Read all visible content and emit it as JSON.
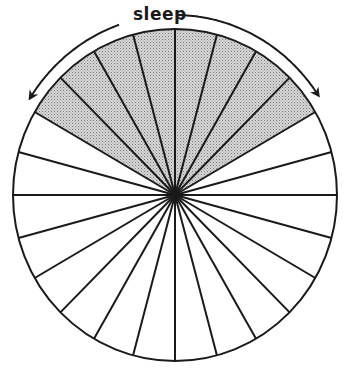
{
  "diagram": {
    "type": "24-hour day clock pie",
    "label": "sleep",
    "total_sectors": 24,
    "sector_degrees": 15,
    "shaded": {
      "start_deg": -60,
      "end_deg": 60,
      "sector_count": 8,
      "meaning": "sleep"
    },
    "unshaded_sector_count": 16,
    "colors": {
      "line": "#1a1a1a",
      "shade": "#c8c8c8",
      "shade_dot": "#8a8a8a",
      "background": "#ffffff"
    }
  },
  "chart_data": {
    "type": "pie",
    "title": "",
    "annotation": "sleep",
    "categories": [
      "sleep",
      "awake"
    ],
    "values": [
      8,
      16
    ],
    "units": "hours (sectors of 24)",
    "total": 24
  }
}
